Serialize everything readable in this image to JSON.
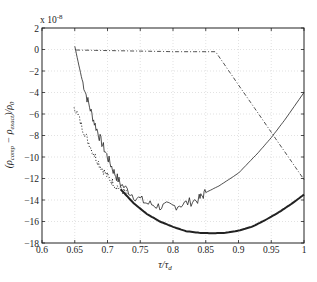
{
  "chart_data": {
    "type": "line",
    "title": "",
    "xlabel": "τ/τ_d",
    "ylabel": "(ρ_comp − ρ_exact)/ρ_0",
    "y_multiplier": "x 10^-8",
    "xlim": [
      0.6,
      1.0
    ],
    "ylim": [
      -18,
      2
    ],
    "x_ticks": [
      "0.6",
      "0.65",
      "0.7",
      "0.75",
      "0.8",
      "0.85",
      "0.9",
      "0.95",
      "1"
    ],
    "y_ticks": [
      "2",
      "0",
      "-2",
      "-4",
      "-6",
      "-8",
      "-10",
      "-12",
      "-14",
      "-16",
      "-18"
    ],
    "grid": true,
    "legend": null,
    "series": [
      {
        "name": "thin solid (noisy)",
        "style": "solid-thin",
        "x": [
          0.65,
          0.66,
          0.67,
          0.68,
          0.69,
          0.7,
          0.71,
          0.72,
          0.74,
          0.76,
          0.78,
          0.8,
          0.82,
          0.84,
          0.85,
          0.87,
          0.9,
          0.93,
          0.95,
          0.97,
          1.0
        ],
        "y": [
          0.3,
          -2.5,
          -4.8,
          -6.8,
          -8.5,
          -10.0,
          -11.4,
          -12.5,
          -13.6,
          -14.3,
          -14.6,
          -14.6,
          -14.3,
          -13.9,
          -13.3,
          -12.7,
          -11.5,
          -9.6,
          -8.2,
          -6.6,
          -4.0
        ]
      },
      {
        "name": "dotted",
        "style": "dotted",
        "x": [
          0.649,
          0.66,
          0.67,
          0.68,
          0.69,
          0.7,
          0.71,
          0.72,
          0.73
        ],
        "y": [
          -5.2,
          -7.0,
          -8.5,
          -9.8,
          -10.9,
          -11.8,
          -12.5,
          -13.0,
          -13.5
        ]
      },
      {
        "name": "thick solid",
        "style": "solid-thick",
        "x": [
          0.72,
          0.74,
          0.76,
          0.78,
          0.8,
          0.82,
          0.84,
          0.86,
          0.88,
          0.9,
          0.92,
          0.94,
          0.96,
          0.98,
          1.0
        ],
        "y": [
          -13.0,
          -14.3,
          -15.3,
          -16.0,
          -16.5,
          -16.9,
          -17.05,
          -17.1,
          -17.05,
          -16.85,
          -16.5,
          -15.9,
          -15.2,
          -14.4,
          -13.5
        ]
      },
      {
        "name": "dash-dot",
        "style": "dash-dot",
        "x": [
          0.652,
          0.7,
          0.75,
          0.8,
          0.865,
          0.9,
          0.95,
          1.0
        ],
        "y": [
          -0.05,
          -0.1,
          -0.15,
          -0.2,
          -0.2,
          -3.3,
          -7.7,
          -12.1
        ]
      }
    ]
  }
}
